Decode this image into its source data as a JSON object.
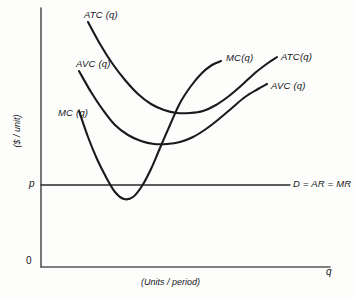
{
  "chart_data": {
    "type": "line",
    "title": "",
    "subtitle": "",
    "xlabel": "(Units / period)",
    "ylabel": "($ / unit)",
    "x_axis_end_symbol": "q",
    "origin_label": "0",
    "grid": false,
    "legend": "inline-curve-labels",
    "xlim": [
      0,
      1
    ],
    "ylim": [
      0,
      1
    ],
    "annotations": {
      "price_tick": "p",
      "demand_line": "D = AR = MR"
    },
    "series": [
      {
        "name": "MC(q)",
        "label_left": "MC (q)",
        "label_right": "MC(q)",
        "shape": "u-shaped marginal cost",
        "points": [
          [
            79,
            111
          ],
          [
            88,
            137
          ],
          [
            97,
            159
          ],
          [
            106,
            177
          ],
          [
            115,
            192
          ],
          [
            124,
            199
          ],
          [
            133,
            197
          ],
          [
            142,
            186
          ],
          [
            151,
            169
          ],
          [
            160,
            148
          ],
          [
            170,
            125
          ],
          [
            180,
            103
          ],
          [
            191,
            86
          ],
          [
            202,
            73
          ],
          [
            212,
            65
          ],
          [
            221,
            61
          ]
        ],
        "minimum": [
          124,
          199
        ],
        "label_pos": [
          60,
          116
        ],
        "label_right_pos": [
          228,
          60
        ]
      },
      {
        "name": "AVC(q)",
        "label_left": "AVC (q)",
        "label_right": "AVC (q)",
        "shape": "u-shaped average variable cost",
        "points": [
          [
            79,
            71
          ],
          [
            91,
            92
          ],
          [
            103,
            110
          ],
          [
            115,
            125
          ],
          [
            128,
            135
          ],
          [
            141,
            141
          ],
          [
            154,
            144
          ],
          [
            167,
            144
          ],
          [
            180,
            142
          ],
          [
            193,
            137
          ],
          [
            206,
            129
          ],
          [
            219,
            119
          ],
          [
            232,
            108
          ],
          [
            245,
            97
          ],
          [
            258,
            89
          ],
          [
            267,
            84
          ]
        ],
        "minimum": [
          167,
          144
        ],
        "label_pos": [
          78,
          66
        ],
        "label_right_pos": [
          272,
          89
        ]
      },
      {
        "name": "ATC(q)",
        "label_left": "ATC (q)",
        "label_right": "ATC(q)",
        "shape": "u-shaped average total cost",
        "points": [
          [
            88,
            22
          ],
          [
            100,
            44
          ],
          [
            112,
            63
          ],
          [
            125,
            80
          ],
          [
            138,
            94
          ],
          [
            151,
            104
          ],
          [
            164,
            110
          ],
          [
            177,
            113
          ],
          [
            190,
            113
          ],
          [
            203,
            111
          ],
          [
            216,
            105
          ],
          [
            229,
            96
          ],
          [
            242,
            85
          ],
          [
            255,
            73
          ],
          [
            268,
            63
          ],
          [
            277,
            57
          ]
        ],
        "minimum": [
          190,
          113
        ],
        "label_pos": [
          84,
          17
        ],
        "label_right_pos": [
          282,
          62
        ]
      }
    ],
    "demand_line": {
      "name": "D = AR = MR",
      "y": 185,
      "x_start": 41,
      "x_end": 290,
      "horizontal": true,
      "label_pos": [
        294,
        186
      ]
    },
    "axes": {
      "x_start": 41,
      "x_end": 330,
      "y_top": 8,
      "y_bottom": 267
    },
    "colors": {
      "curve": "#1a1a1e",
      "axis": "#555559",
      "demand": "#2a2a2e",
      "background": "#fdfdfc"
    }
  },
  "labels": {
    "atc_left": "ATC (q)",
    "avc_left": "AVC (q)",
    "mc_left": "MC (q)",
    "mc_right": "MC(q)",
    "atc_right": "ATC(q)",
    "avc_right": "AVC (q)",
    "demand": "D = AR = MR",
    "price_tick": "p",
    "origin": "0",
    "q_symbol": "q",
    "xlabel": "(Units / period)",
    "ylabel": "($ / unit)"
  }
}
